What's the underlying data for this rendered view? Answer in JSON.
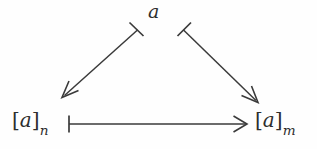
{
  "figure": {
    "kind": "commutative-triangle-diagram",
    "background_color": "#fefefe",
    "stroke_color": "#3a3a3a",
    "width": 317,
    "height": 149,
    "nodes": [
      {
        "id": "apex",
        "name": "apex-node",
        "base": "a",
        "bracket_open": "",
        "bracket_close": "",
        "subscript": "",
        "text": "a",
        "x": 155,
        "y": 12
      },
      {
        "id": "left",
        "name": "lower-left-node",
        "base": "a",
        "bracket_open": "[",
        "bracket_close": "]",
        "subscript": "n",
        "text": "[a]n",
        "x": 38,
        "y": 124
      },
      {
        "id": "right",
        "name": "lower-right-node",
        "base": "a",
        "bracket_open": "[",
        "bracket_close": "]",
        "subscript": "m",
        "text": "[a]m",
        "x": 280,
        "y": 124
      }
    ],
    "arrows": [
      {
        "id": "apex-to-left",
        "name": "arrow-apex-to-lower-left",
        "glyph": "mapsto-arrow",
        "tail": "bar",
        "head": "open-arrowhead",
        "from": "apex",
        "to": "left",
        "label": ""
      },
      {
        "id": "apex-to-right",
        "name": "arrow-apex-to-lower-right",
        "glyph": "mapsto-arrow",
        "tail": "bar",
        "head": "open-arrowhead",
        "from": "apex",
        "to": "right",
        "label": ""
      },
      {
        "id": "left-to-right",
        "name": "arrow-lower-left-to-lower-right",
        "glyph": "mapsto-arrow",
        "tail": "bar",
        "head": "open-arrowhead",
        "from": "left",
        "to": "right",
        "label": ""
      }
    ]
  }
}
